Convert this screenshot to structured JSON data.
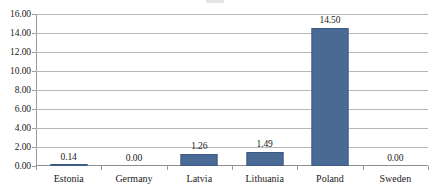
{
  "chart_data": {
    "type": "bar",
    "title": "",
    "subtitle": "",
    "xlabel": "",
    "ylabel": "",
    "categories": [
      "Estonia",
      "Germany",
      "Latvia",
      "Lithuania",
      "Poland",
      "Sweden"
    ],
    "values": [
      0.14,
      0.0,
      1.26,
      1.49,
      14.5,
      0.0
    ],
    "data_labels": [
      "0.14",
      "0.00",
      "1.26",
      "1.49",
      "14.50",
      "0.00"
    ],
    "ylim": [
      0,
      16
    ],
    "ytick_step": 2,
    "ytick_labels": [
      "0.00",
      "2.00",
      "4.00",
      "6.00",
      "8.00",
      "10.00",
      "12.00",
      "14.00",
      "16.00"
    ],
    "ytick_values": [
      0,
      2,
      4,
      6,
      8,
      10,
      12,
      14,
      16
    ],
    "grid": true,
    "grid_axis": "y",
    "legend": false,
    "legend_position": "none",
    "series": [
      {
        "name": "",
        "values": [
          0.14,
          0.0,
          1.26,
          1.49,
          14.5,
          0.0
        ]
      }
    ]
  },
  "style": {
    "bar_color": "#4A6A96",
    "bar_border_color": "#3D5B84",
    "gridline_color": "#B7B7B7",
    "axis_color": "#9A9A9A",
    "text_color": "#1A1A1A",
    "background": "#FFFFFF"
  }
}
